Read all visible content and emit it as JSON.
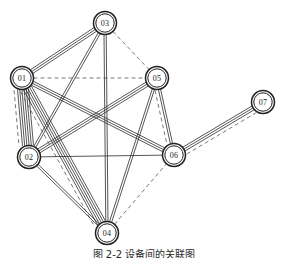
{
  "figure": {
    "caption": "图 2-2   设备间的关联图",
    "background_color": "#ffffff",
    "line_color": "#2b2b2b",
    "dashed_line_color": "#555555",
    "node_fill": "#ffffff",
    "node_stroke": "#1f1f1f"
  },
  "chart_data": {
    "type": "diagram",
    "title": "图 2-2   设备间的关联图",
    "layout": "node-link multigraph",
    "node_shape": "double-circle",
    "nodes": [
      {
        "id": "01",
        "label": "01",
        "x": 22,
        "y": 78
      },
      {
        "id": "02",
        "label": "02",
        "x": 29,
        "y": 157
      },
      {
        "id": "03",
        "label": "03",
        "x": 105,
        "y": 23
      },
      {
        "id": "04",
        "label": "04",
        "x": 107,
        "y": 233
      },
      {
        "id": "05",
        "label": "05",
        "x": 157,
        "y": 78
      },
      {
        "id": "06",
        "label": "06",
        "x": 174,
        "y": 155
      },
      {
        "id": "07",
        "label": "07",
        "x": 263,
        "y": 102
      }
    ],
    "edges": [
      {
        "source": "01",
        "target": "03",
        "solid": 3,
        "dashed": 0
      },
      {
        "source": "01",
        "target": "02",
        "solid": 6,
        "dashed": 1
      },
      {
        "source": "01",
        "target": "04",
        "solid": 5,
        "dashed": 1
      },
      {
        "source": "01",
        "target": "05",
        "solid": 0,
        "dashed": 1
      },
      {
        "source": "01",
        "target": "06",
        "solid": 3,
        "dashed": 0
      },
      {
        "source": "02",
        "target": "03",
        "solid": 2,
        "dashed": 0
      },
      {
        "source": "02",
        "target": "05",
        "solid": 3,
        "dashed": 0
      },
      {
        "source": "02",
        "target": "04",
        "solid": 2,
        "dashed": 0
      },
      {
        "source": "02",
        "target": "06",
        "solid": 1,
        "dashed": 0
      },
      {
        "source": "03",
        "target": "05",
        "solid": 0,
        "dashed": 1
      },
      {
        "source": "03",
        "target": "04",
        "solid": 2,
        "dashed": 0
      },
      {
        "source": "05",
        "target": "04",
        "solid": 2,
        "dashed": 0
      },
      {
        "source": "05",
        "target": "06",
        "solid": 2,
        "dashed": 1
      },
      {
        "source": "06",
        "target": "07",
        "solid": 3,
        "dashed": 1
      },
      {
        "source": "04",
        "target": "06",
        "solid": 0,
        "dashed": 1
      }
    ],
    "node_count": 7,
    "edge_bundle_count": 15,
    "legend": [],
    "xlabel": "",
    "ylabel": ""
  }
}
